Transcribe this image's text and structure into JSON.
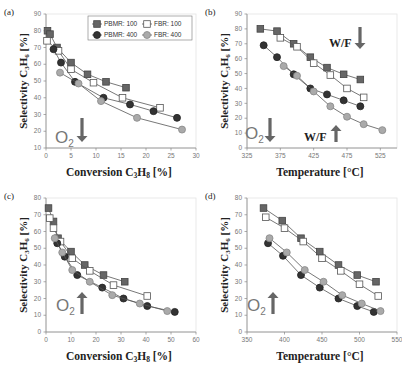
{
  "figure": {
    "colors": {
      "pbmr100": "#666666",
      "fbr100": "#ffffff",
      "pbmr400": "#333333",
      "fbr400": "#aaaaaa",
      "line": "#555555",
      "arrow": "#666666"
    }
  },
  "chart_data": [
    {
      "id": "a",
      "type": "line",
      "panel_label": "(a)",
      "xlabel": "Conversion C3H8 [%]",
      "ylabel": "Selectivity C3H6 [%]",
      "xlim": [
        0,
        30
      ],
      "ylim": [
        10,
        90
      ],
      "xticks": [
        0,
        5,
        10,
        15,
        20,
        25,
        30
      ],
      "yticks": [
        10,
        20,
        30,
        40,
        50,
        60,
        70,
        80,
        90
      ],
      "legend": [
        "PBMR: 100",
        "FBR: 100",
        "PBMR: 400",
        "FBR: 400"
      ],
      "legend_position": "top-right",
      "annotations": [
        {
          "text": "O2",
          "arrow": "down"
        }
      ],
      "series": [
        {
          "name": "PBMR: 100",
          "points": [
            [
              0.3,
              80
            ],
            [
              0.8,
              78
            ],
            [
              2.2,
              70
            ],
            [
              5.0,
              61
            ],
            [
              8.3,
              54
            ],
            [
              12.0,
              49.5
            ],
            [
              16.0,
              46
            ]
          ]
        },
        {
          "name": "FBR: 100",
          "points": [
            [
              0.2,
              74
            ],
            [
              2.5,
              68
            ],
            [
              5.0,
              57
            ],
            [
              9.5,
              49
            ],
            [
              15.3,
              40
            ],
            [
              22.8,
              34
            ]
          ]
        },
        {
          "name": "PBMR: 400",
          "points": [
            [
              1.5,
              69
            ],
            [
              3.0,
              61
            ],
            [
              5.8,
              49.5
            ],
            [
              11.5,
              40
            ],
            [
              16.8,
              36
            ],
            [
              21.5,
              32
            ],
            [
              26.2,
              28
            ]
          ]
        },
        {
          "name": "FBR: 400",
          "points": [
            [
              2.8,
              55
            ],
            [
              6.5,
              48.5
            ],
            [
              11.0,
              38
            ],
            [
              18.2,
              28
            ],
            [
              27.2,
              21
            ]
          ]
        }
      ]
    },
    {
      "id": "b",
      "type": "line",
      "panel_label": "(b)",
      "xlabel": "Temperature [°C]",
      "ylabel": "Selectivity C3H6 [%]",
      "xlim": [
        325,
        550
      ],
      "ylim": [
        0,
        90
      ],
      "xticks": [
        325,
        375,
        425,
        475,
        525
      ],
      "yticks": [
        0,
        10,
        20,
        30,
        40,
        50,
        60,
        70,
        80,
        90
      ],
      "annotations": [
        {
          "text": "W/F",
          "arrow": "down"
        },
        {
          "text": "O2",
          "arrow": "down"
        },
        {
          "text": "W/F",
          "arrow": "up"
        }
      ],
      "series": [
        {
          "name": "PBMR: 100",
          "points": [
            [
              345,
              80
            ],
            [
              370,
              78.5
            ],
            [
              395,
              70
            ],
            [
              420,
              61
            ],
            [
              445,
              54
            ],
            [
              470,
              49.5
            ],
            [
              495,
              46
            ]
          ]
        },
        {
          "name": "FBR: 100",
          "points": [
            [
              375,
              74
            ],
            [
              400,
              68
            ],
            [
              425,
              57
            ],
            [
              450,
              49
            ],
            [
              475,
              40
            ],
            [
              500,
              34
            ]
          ]
        },
        {
          "name": "PBMR: 400",
          "points": [
            [
              350,
              69
            ],
            [
              370,
              61
            ],
            [
              395,
              49.5
            ],
            [
              420,
              40
            ],
            [
              445,
              36
            ],
            [
              470,
              32
            ],
            [
              495,
              28
            ]
          ]
        },
        {
          "name": "FBR: 400",
          "points": [
            [
              380,
              55
            ],
            [
              400,
              48.5
            ],
            [
              425,
              38
            ],
            [
              450,
              28
            ],
            [
              475,
              21
            ],
            [
              500,
              16
            ],
            [
              528,
              12
            ]
          ]
        }
      ]
    },
    {
      "id": "c",
      "type": "line",
      "panel_label": "(c)",
      "xlabel": "Conversion C3H8 [%]",
      "ylabel": "Selectivity C3H6 [%]",
      "xlim": [
        0,
        60
      ],
      "ylim": [
        0,
        80
      ],
      "xticks": [
        0,
        10,
        20,
        30,
        40,
        50,
        60
      ],
      "yticks": [
        0,
        10,
        20,
        30,
        40,
        50,
        60,
        70,
        80
      ],
      "annotations": [
        {
          "text": "O2",
          "arrow": "up"
        }
      ],
      "series": [
        {
          "name": "PBMR: 100",
          "points": [
            [
              1.0,
              74
            ],
            [
              3.0,
              66
            ],
            [
              4.8,
              56
            ],
            [
              10.0,
              48
            ],
            [
              15.5,
              40
            ],
            [
              23.0,
              34
            ],
            [
              31.5,
              30
            ]
          ]
        },
        {
          "name": "FBR: 100",
          "points": [
            [
              1.5,
              68
            ],
            [
              3.0,
              62
            ],
            [
              5.8,
              54
            ],
            [
              10.5,
              44
            ],
            [
              17.5,
              36.5
            ],
            [
              27.0,
              28
            ],
            [
              40.5,
              21.5
            ]
          ]
        },
        {
          "name": "PBMR: 400",
          "points": [
            [
              4.5,
              53
            ],
            [
              7.5,
              45
            ],
            [
              12.5,
              34
            ],
            [
              22.5,
              26.5
            ],
            [
              31.0,
              20
            ],
            [
              40.5,
              15.5
            ],
            [
              51.5,
              12
            ]
          ]
        },
        {
          "name": "FBR: 400",
          "points": [
            [
              3.5,
              56
            ],
            [
              6.5,
              47.5
            ],
            [
              10.5,
              37
            ],
            [
              17.5,
              30
            ],
            [
              26.5,
              22
            ],
            [
              37.5,
              17
            ],
            [
              48.5,
              12.5
            ]
          ]
        }
      ]
    },
    {
      "id": "d",
      "type": "line",
      "panel_label": "(d)",
      "xlabel": "Temperature [°C]",
      "ylabel": "Selectivity C3H6 [%]",
      "xlim": [
        350,
        550
      ],
      "ylim": [
        0,
        80
      ],
      "xticks": [
        350,
        400,
        450,
        500,
        550
      ],
      "yticks": [
        0,
        10,
        20,
        30,
        40,
        50,
        60,
        70,
        80
      ],
      "annotations": [
        {
          "text": "O2",
          "arrow": "up"
        }
      ],
      "series": [
        {
          "name": "PBMR: 100",
          "points": [
            [
              372,
              74
            ],
            [
              397,
              66.5
            ],
            [
              422,
              56
            ],
            [
              447,
              48
            ],
            [
              472,
              40
            ],
            [
              497,
              34
            ],
            [
              522,
              30
            ]
          ]
        },
        {
          "name": "FBR: 100",
          "points": [
            [
              375,
              68.5
            ],
            [
              400,
              62
            ],
            [
              425,
              54
            ],
            [
              450,
              44
            ],
            [
              475,
              36.5
            ],
            [
              500,
              28.5
            ],
            [
              525,
              21.5
            ]
          ]
        },
        {
          "name": "PBMR: 400",
          "points": [
            [
              378,
              53
            ],
            [
              398,
              45.5
            ],
            [
              422,
              34
            ],
            [
              447,
              26.5
            ],
            [
              472,
              20
            ],
            [
              497,
              15.5
            ],
            [
              519,
              12
            ]
          ]
        },
        {
          "name": "FBR: 400",
          "points": [
            [
              380,
              56
            ],
            [
              403,
              47.5
            ],
            [
              427,
              37
            ],
            [
              452,
              30
            ],
            [
              477,
              22
            ],
            [
              503,
              17
            ],
            [
              528,
              12.5
            ]
          ]
        }
      ]
    }
  ]
}
